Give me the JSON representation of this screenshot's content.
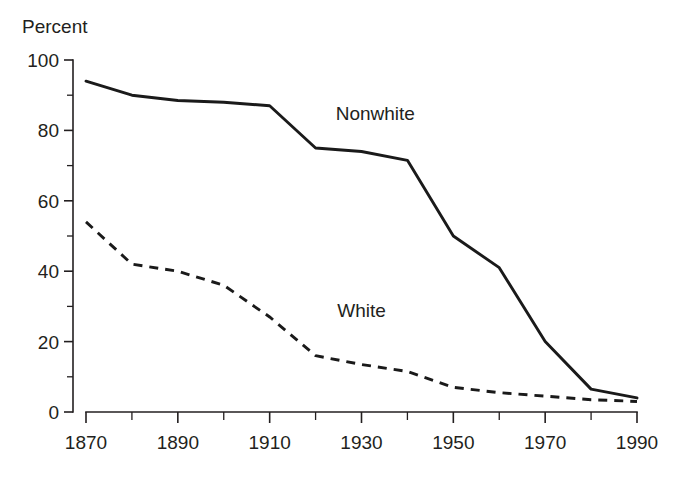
{
  "chart_data": {
    "type": "line",
    "title": "",
    "subtitle": "",
    "xlabel": "",
    "ylabel": "Percent",
    "ylabel_position": "top-left",
    "x": [
      1870,
      1880,
      1890,
      1900,
      1910,
      1920,
      1930,
      1940,
      1950,
      1960,
      1970,
      1980,
      1990
    ],
    "xlim": [
      1870,
      1990
    ],
    "ylim": [
      0,
      100
    ],
    "grid": false,
    "legend": "inline-annotation",
    "x_major_ticks": [
      1870,
      1890,
      1910,
      1930,
      1950,
      1970,
      1990
    ],
    "x_major_tick_labels": [
      "1870",
      "1890",
      "1910",
      "1930",
      "1950",
      "1970",
      "1990"
    ],
    "x_minor_ticks": [
      1880,
      1900,
      1920,
      1940,
      1960,
      1980
    ],
    "y_major_ticks": [
      0,
      20,
      40,
      60,
      80,
      100
    ],
    "y_major_tick_labels": [
      "0",
      "20",
      "40",
      "60",
      "80",
      "100"
    ],
    "y_minor_ticks": [
      10,
      30,
      50,
      70,
      90
    ],
    "series": [
      {
        "name": "Nonwhite",
        "style": "solid",
        "color": "#1a1a1a",
        "label_x": 1933,
        "label_y": 83,
        "values": [
          94,
          90,
          88.5,
          88,
          87,
          75,
          74,
          71.5,
          50,
          41,
          20,
          6.5,
          4
        ]
      },
      {
        "name": "White",
        "style": "dashed",
        "color": "#1a1a1a",
        "label_x": 1930,
        "label_y": 27,
        "values": [
          54,
          42,
          40,
          36,
          27,
          16,
          13.5,
          11.5,
          7,
          5.5,
          4.5,
          3.5,
          3
        ]
      }
    ]
  }
}
